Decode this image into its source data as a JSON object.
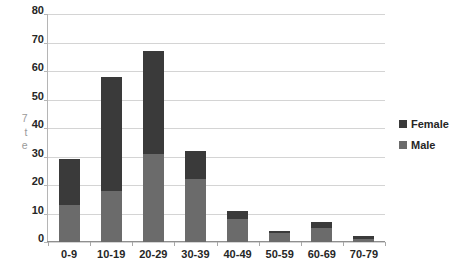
{
  "chart_data": {
    "type": "bar",
    "stacked": true,
    "title": "",
    "subtitle": "",
    "xlabel": "",
    "ylabel": "",
    "categories": [
      "0-9",
      "10-19",
      "20-29",
      "30-39",
      "40-49",
      "50-59",
      "60-69",
      "70-79"
    ],
    "series": [
      {
        "name": "Male",
        "color": "#6b6b6b",
        "values": [
          13,
          18,
          31,
          22,
          8,
          3,
          5,
          1
        ]
      },
      {
        "name": "Female",
        "color": "#3a3a3a",
        "values": [
          16,
          40,
          36,
          10,
          3,
          1,
          2,
          1
        ]
      }
    ],
    "totals": [
      29,
      58,
      67,
      32,
      11,
      4,
      7,
      2
    ],
    "ylim": [
      0,
      80
    ],
    "ytick_step": 10,
    "yticks": [
      0,
      10,
      20,
      30,
      40,
      50,
      60,
      70,
      80
    ],
    "ytick_labels": [
      "0",
      "10",
      "20",
      "30",
      "40",
      "50",
      "60",
      "70",
      "80"
    ],
    "grid": true,
    "grid_axis": "y",
    "legend_position": "right",
    "legend_entries": [
      "Female",
      "Male"
    ],
    "annotations": []
  },
  "axis_title_remnant": "7\nt\ne",
  "colors": {
    "female": "#3a3a3a",
    "male": "#6b6b6b",
    "gridline": "#d4d4d4",
    "axis": "#8f8f8f",
    "text": "#262626",
    "background": "#ffffff"
  }
}
